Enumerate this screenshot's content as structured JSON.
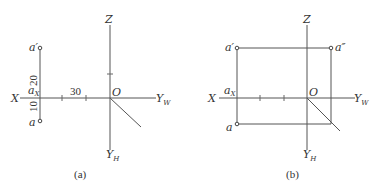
{
  "panels": [
    {
      "id": "a",
      "caption": "(a)",
      "axes": {
        "x": "X",
        "z": "Z",
        "origin": "O",
        "yw": "Y",
        "yw_sub": "W",
        "yh": "Y",
        "yh_sub": "H"
      },
      "points": {
        "a_prime": "a′",
        "a": "a",
        "ax": "a",
        "ax_sub": "X"
      },
      "dimensions": {
        "horizontal": "30",
        "upper": "20",
        "lower": "10"
      }
    },
    {
      "id": "b",
      "caption": "(b)",
      "axes": {
        "x": "X",
        "z": "Z",
        "origin": "O",
        "yw": "Y",
        "yw_sub": "W",
        "yh": "Y",
        "yh_sub": "H"
      },
      "points": {
        "a_prime": "a′",
        "a_double_prime": "a″",
        "a": "a",
        "ax": "a",
        "ax_sub": "X"
      }
    }
  ],
  "colors": {
    "line": "#555555",
    "text": "#333333",
    "background": "#ffffff"
  }
}
